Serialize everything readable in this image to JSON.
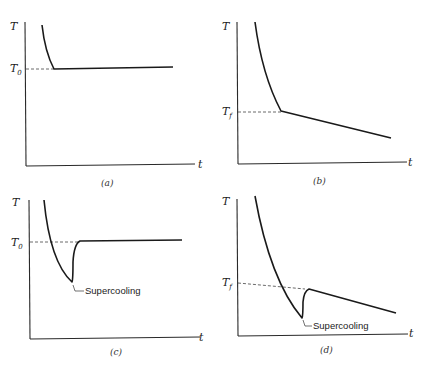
{
  "panels": [
    {
      "id": "a",
      "caption": "(a)",
      "y_label": "T",
      "x_label": "t",
      "ref_label": "T",
      "ref_sub": "0",
      "annotation": null
    },
    {
      "id": "b",
      "caption": "(b)",
      "y_label": "T",
      "x_label": "t",
      "ref_label": "T",
      "ref_sub": "f",
      "annotation": null
    },
    {
      "id": "c",
      "caption": "(c)",
      "y_label": "T",
      "x_label": "t",
      "ref_label": "T",
      "ref_sub": "0",
      "annotation": "Supercooling"
    },
    {
      "id": "d",
      "caption": "(d)",
      "y_label": "T",
      "x_label": "t",
      "ref_label": "T",
      "ref_sub": "f",
      "annotation": "Supercooling"
    }
  ],
  "colors": {
    "line": "#1a1a1a",
    "background": "#ffffff"
  }
}
